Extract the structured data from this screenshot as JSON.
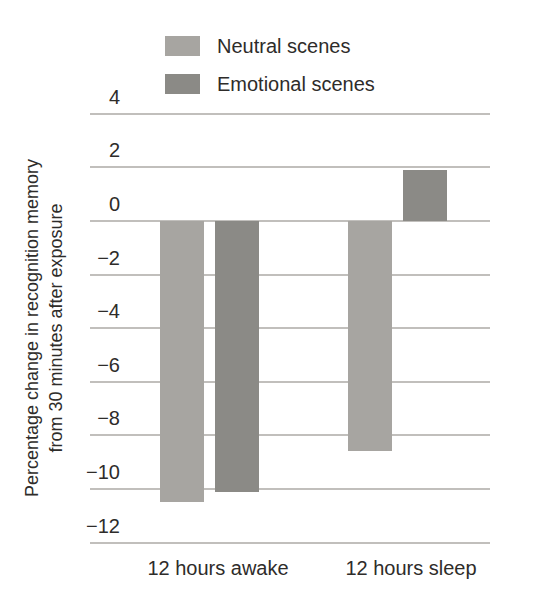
{
  "chart_data": {
    "type": "bar",
    "title": "",
    "categories": [
      "12 hours awake",
      "12 hours sleep"
    ],
    "series": [
      {
        "name": "Neutral scenes",
        "color": "#a7a5a1",
        "values": [
          -10.5,
          -8.6
        ]
      },
      {
        "name": "Emotional scenes",
        "color": "#8b8a86",
        "values": [
          -10.1,
          1.9
        ]
      }
    ],
    "ylabel_line1": "Percentage change in recognition memory",
    "ylabel_line2": "from 30 minutes after exposure",
    "yticks": [
      4,
      2,
      0,
      -2,
      -4,
      -6,
      -8,
      -10,
      -12
    ],
    "ylim": [
      -13,
      5
    ],
    "grid": true,
    "legend_position": "top",
    "colors": {
      "background": "#ffffff",
      "gridline": "#c1bfbc",
      "text": "#2e2c2a"
    }
  }
}
